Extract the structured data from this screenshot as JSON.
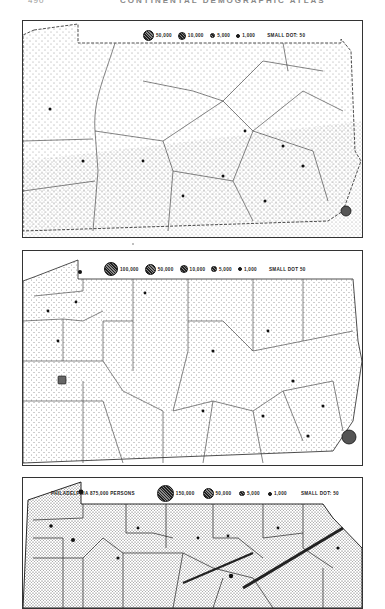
{
  "page": {
    "page_number": "490",
    "running_head": "CONTINENTAL DEMOGRAPHIC ATLAS"
  },
  "maps": [
    {
      "id": "map-1",
      "legend": [
        {
          "label": "50,000",
          "size": 9
        },
        {
          "label": "10,000",
          "size": 6
        },
        {
          "label": "5,000",
          "size": 3.5
        },
        {
          "label": "1,000",
          "size": 2
        },
        {
          "label": "SMALL DOT: 50",
          "size": 0
        }
      ]
    },
    {
      "id": "map-2",
      "legend": [
        {
          "label": "100,000",
          "size": 12
        },
        {
          "label": "50,000",
          "size": 9
        },
        {
          "label": "10,000",
          "size": 6
        },
        {
          "label": "5,000",
          "size": 3.5
        },
        {
          "label": "1,000",
          "size": 2
        },
        {
          "label": "SMALL DOT 50",
          "size": 0
        }
      ]
    },
    {
      "id": "map-3",
      "note": "PHILADELPHIA 875,000 PERSONS",
      "legend": [
        {
          "label": "150,000",
          "size": 15
        },
        {
          "label": "50,000",
          "size": 9
        },
        {
          "label": "5,000",
          "size": 3.5
        },
        {
          "label": "1,000",
          "size": 2
        },
        {
          "label": "SMALL DOT: 50",
          "size": 0
        }
      ]
    }
  ]
}
